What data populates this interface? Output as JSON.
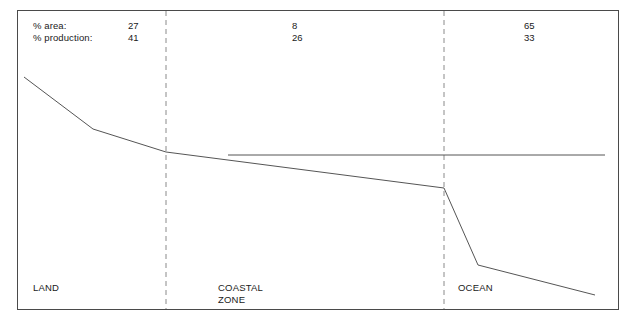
{
  "figure": {
    "title": "",
    "rows": [
      {
        "label": "% area:",
        "values": [
          "27",
          "8",
          "65"
        ]
      },
      {
        "label": "% production:",
        "values": [
          "41",
          "26",
          "33"
        ]
      }
    ],
    "zones": [
      {
        "name": "LAND",
        "line1": "LAND",
        "line2": ""
      },
      {
        "name": "COASTAL ZONE",
        "line1": "COASTAL",
        "line2": "ZONE"
      },
      {
        "name": "OCEAN",
        "line1": "OCEAN",
        "line2": ""
      }
    ],
    "colors": {
      "border": "#4a4a4a",
      "curve": "#555555",
      "divider": "#8a8a8a",
      "background": "#ffffff",
      "text": "#1a1a1a"
    }
  },
  "chart_data": {
    "type": "line",
    "title": "",
    "xlabel": "",
    "ylabel": "",
    "grid": false,
    "legend": "none",
    "xlim": [
      17,
      619
    ],
    "ylim": [
      310,
      10
    ],
    "annotations": {
      "header_row_labels": [
        "% area:",
        "% production:"
      ],
      "zone_labels": [
        "LAND",
        "COASTAL ZONE",
        "OCEAN"
      ],
      "percent_area": [
        27,
        8,
        65
      ],
      "percent_production": [
        41,
        26,
        33
      ]
    },
    "dividers": {
      "type": "dashed-vertical",
      "x": [
        166,
        444
      ]
    },
    "series": [
      {
        "name": "main-profile",
        "style": "solid",
        "points": [
          [
            24,
            77
          ],
          [
            93,
            129
          ],
          [
            166,
            152
          ],
          [
            444,
            188
          ],
          [
            478,
            265
          ],
          [
            595,
            295
          ]
        ]
      },
      {
        "name": "reference-level",
        "style": "solid",
        "points": [
          [
            228,
            155
          ],
          [
            605,
            155
          ]
        ]
      }
    ]
  }
}
